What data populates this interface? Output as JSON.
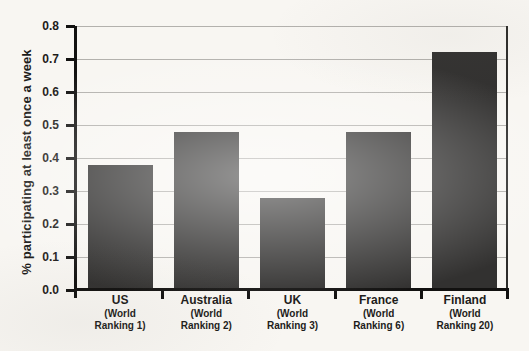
{
  "chart_data": {
    "type": "bar",
    "title": "",
    "xlabel": "",
    "ylabel": "% participating at least once a week",
    "ylim": [
      0,
      0.8
    ],
    "ytick_step": 0.1,
    "ytick_labels": [
      "0.0",
      "0.1",
      "0.2",
      "0.3",
      "0.4",
      "0.5",
      "0.6",
      "0.7",
      "0.8"
    ],
    "grid": "horizontal",
    "legend": "none",
    "categories": [
      "US",
      "Australia",
      "UK",
      "France",
      "Finland"
    ],
    "sublabels": [
      "(World Ranking 1)",
      "(World Ranking 2)",
      "(World Ranking 3)",
      "(World Ranking 6)",
      "(World Ranking 20)"
    ],
    "values": [
      0.38,
      0.48,
      0.28,
      0.48,
      0.72
    ]
  },
  "colors": {
    "background": "#f8f6f2",
    "bar": "#323130",
    "axis": "#121110",
    "gridline": "#b3b1ad",
    "right_border": "#2d2c2a",
    "text": "#1d1c1a"
  }
}
